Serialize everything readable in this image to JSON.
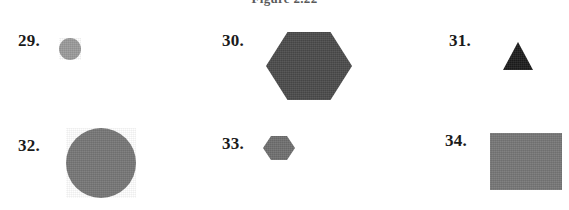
{
  "page": {
    "width": 569,
    "height": 210,
    "background_color": "#ffffff",
    "caption": "Figure 2.22"
  },
  "items": [
    {
      "number": "29.",
      "label_x": 18,
      "label_y": 31,
      "shape": "circle",
      "shape_name": "gray-circle-small",
      "fill": "#9a9a9a",
      "x": 59,
      "y": 38,
      "width": 22,
      "height": 22
    },
    {
      "number": "30.",
      "label_x": 222,
      "label_y": 31,
      "shape": "hexagon",
      "shape_name": "dark-gray-hexagon-large",
      "fill": "#4a4a4a",
      "x": 266,
      "y": 32,
      "width": 86,
      "height": 68
    },
    {
      "number": "31.",
      "label_x": 449,
      "label_y": 31,
      "shape": "triangle",
      "shape_name": "black-triangle-small",
      "fill": "#1c1c1c",
      "x": 503,
      "y": 42,
      "width": 30,
      "height": 28
    },
    {
      "number": "32.",
      "label_x": 18,
      "label_y": 136,
      "shape": "circle",
      "shape_name": "gray-circle-large",
      "fill": "#767676",
      "x": 66,
      "y": 128,
      "width": 70,
      "height": 70
    },
    {
      "number": "33.",
      "label_x": 222,
      "label_y": 134,
      "shape": "hexagon",
      "shape_name": "gray-hexagon-small",
      "fill": "#6e6e6e",
      "x": 263,
      "y": 136,
      "width": 32,
      "height": 24
    },
    {
      "number": "34.",
      "label_x": 445,
      "label_y": 131,
      "shape": "rect",
      "shape_name": "gray-rectangle",
      "fill": "#767676",
      "x": 490,
      "y": 133,
      "width": 72,
      "height": 57
    }
  ]
}
